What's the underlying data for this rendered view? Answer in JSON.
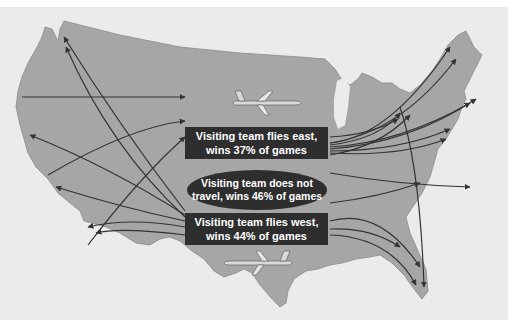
{
  "labels": {
    "east": {
      "line1": "Visiting team flies east,",
      "line2": "wins 37% of games"
    },
    "none": {
      "line1": "Visiting team does not",
      "line2": "travel, wins 46% of games"
    },
    "west": {
      "line1": "Visiting team flies west,",
      "line2": "wins 44% of games"
    }
  },
  "stats": {
    "flies_east_win_pct": 37,
    "no_travel_win_pct": 46,
    "flies_west_win_pct": 44
  },
  "icons": [
    "airplane-icon-east",
    "airplane-icon-west"
  ],
  "colors": {
    "map_fill": "#a6a6a6",
    "background": "#ebebeb",
    "arrow": "#333333",
    "label_box": "#2e2e2e",
    "label_text": "#ffffff"
  }
}
